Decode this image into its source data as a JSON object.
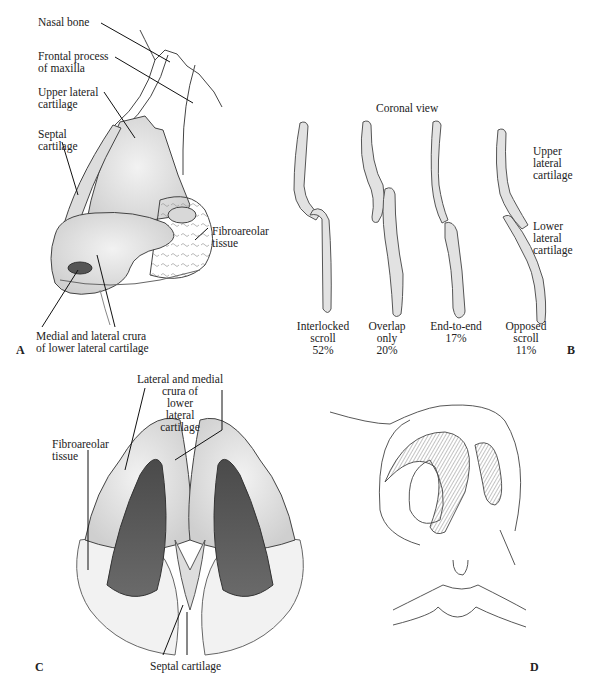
{
  "figure": {
    "panels": [
      {
        "id": "A",
        "letter": "A",
        "labels": {
          "nasal_bone": "Nasal bone",
          "frontal_process": "Frontal process\nof maxilla",
          "upper_lateral": "Upper lateral\ncartilage",
          "septal": "Septal\ncartilage",
          "fibroareolar": "Fibroareolar\ntissue",
          "crura": "Medial and lateral crura\nof lower lateral cartilage"
        }
      },
      {
        "id": "B",
        "letter": "B",
        "title": "Coronal view",
        "side_labels": {
          "upper": "Upper\nlateral\ncartilage",
          "lower": "Lower\nlateral\ncartilage"
        },
        "types": [
          {
            "name": "Interlocked\nscroll",
            "percent": "52%"
          },
          {
            "name": "Overlap\nonly",
            "percent": "20%"
          },
          {
            "name": "End-to-end",
            "percent": "17%"
          },
          {
            "name": "Opposed\nscroll",
            "percent": "11%"
          }
        ]
      },
      {
        "id": "C",
        "letter": "C",
        "labels": {
          "crura": "Lateral and medial\ncrura of\nlower\nlateral\ncartilage",
          "fibroareolar": "Fibroareolar\ntissue",
          "septal": "Septal cartilage"
        }
      },
      {
        "id": "D",
        "letter": "D"
      }
    ],
    "colors": {
      "cartilage": "#e4e4e4",
      "outline": "#555555",
      "dark_cavity": "#5a5a5a",
      "tissue": "#f0f0f0"
    }
  }
}
